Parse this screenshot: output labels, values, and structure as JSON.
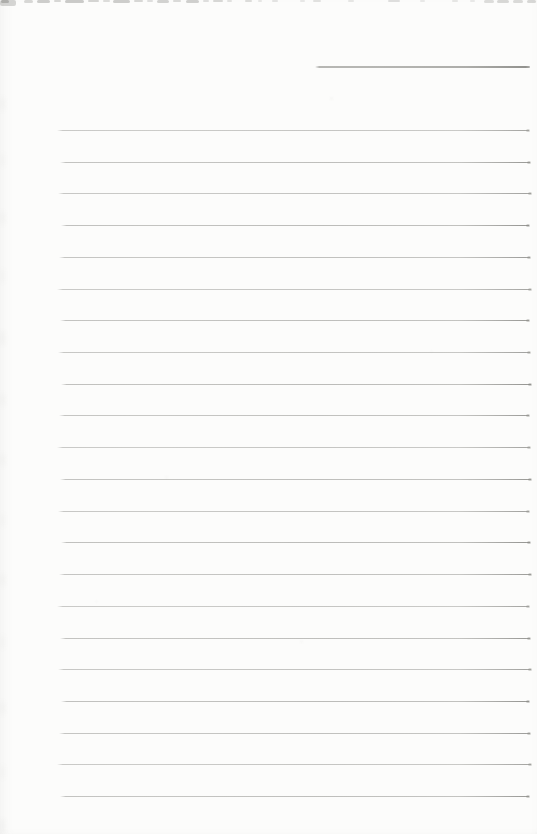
{
  "document": {
    "kind": "scanned blank ruled notebook page",
    "background_color": "#fcfcfb",
    "rule_color": "#a7a7a4",
    "header_line": {
      "x": 315,
      "y": 66,
      "width": 215
    },
    "ruled_lines": {
      "count": 22,
      "x": 59,
      "right_x": 530,
      "first_y": 130,
      "spacing": 31.72,
      "thickness": 1
    },
    "scan_artifacts": {
      "top_edge_dashes": [
        {
          "x": 0,
          "w": 16,
          "h": 6,
          "o": 0.3
        },
        {
          "x": 1,
          "w": 8,
          "h": 3,
          "o": 0.42
        },
        {
          "x": 24,
          "w": 9,
          "h": 3,
          "o": 0.28
        },
        {
          "x": 37,
          "w": 13,
          "h": 3,
          "o": 0.36
        },
        {
          "x": 54,
          "w": 7,
          "h": 2,
          "o": 0.28
        },
        {
          "x": 65,
          "w": 19,
          "h": 3,
          "o": 0.38
        },
        {
          "x": 88,
          "w": 11,
          "h": 2,
          "o": 0.3
        },
        {
          "x": 103,
          "w": 7,
          "h": 2,
          "o": 0.24
        },
        {
          "x": 113,
          "w": 17,
          "h": 3,
          "o": 0.36
        },
        {
          "x": 134,
          "w": 9,
          "h": 2,
          "o": 0.28
        },
        {
          "x": 147,
          "w": 6,
          "h": 2,
          "o": 0.22
        },
        {
          "x": 157,
          "w": 12,
          "h": 3,
          "o": 0.32
        },
        {
          "x": 173,
          "w": 8,
          "h": 2,
          "o": 0.26
        },
        {
          "x": 186,
          "w": 13,
          "h": 3,
          "o": 0.34
        },
        {
          "x": 203,
          "w": 6,
          "h": 2,
          "o": 0.22
        },
        {
          "x": 213,
          "w": 10,
          "h": 2,
          "o": 0.28
        },
        {
          "x": 227,
          "w": 5,
          "h": 2,
          "o": 0.2
        },
        {
          "x": 245,
          "w": 7,
          "h": 2,
          "o": 0.24
        },
        {
          "x": 258,
          "w": 4,
          "h": 2,
          "o": 0.16
        },
        {
          "x": 272,
          "w": 6,
          "h": 2,
          "o": 0.18
        },
        {
          "x": 300,
          "w": 5,
          "h": 2,
          "o": 0.15
        },
        {
          "x": 313,
          "w": 8,
          "h": 2,
          "o": 0.2
        },
        {
          "x": 348,
          "w": 6,
          "h": 2,
          "o": 0.16
        },
        {
          "x": 388,
          "w": 12,
          "h": 2,
          "o": 0.22
        },
        {
          "x": 420,
          "w": 5,
          "h": 2,
          "o": 0.14
        },
        {
          "x": 452,
          "w": 6,
          "h": 2,
          "o": 0.16
        },
        {
          "x": 470,
          "w": 5,
          "h": 2,
          "o": 0.14
        },
        {
          "x": 484,
          "w": 10,
          "h": 3,
          "o": 0.24
        },
        {
          "x": 497,
          "w": 12,
          "h": 3,
          "o": 0.28
        },
        {
          "x": 513,
          "w": 10,
          "h": 3,
          "o": 0.26
        },
        {
          "x": 527,
          "w": 9,
          "h": 3,
          "o": 0.28
        }
      ],
      "left_edge_smudges": [
        {
          "y": 96,
          "o": 0.05
        },
        {
          "y": 152,
          "o": 0.04
        },
        {
          "y": 210,
          "o": 0.05
        },
        {
          "y": 268,
          "o": 0.04
        },
        {
          "y": 330,
          "o": 0.06
        },
        {
          "y": 392,
          "o": 0.05
        },
        {
          "y": 452,
          "o": 0.05
        },
        {
          "y": 512,
          "o": 0.04
        },
        {
          "y": 572,
          "o": 0.05
        },
        {
          "y": 634,
          "o": 0.04
        },
        {
          "y": 700,
          "o": 0.05
        },
        {
          "y": 764,
          "o": 0.04
        },
        {
          "y": 818,
          "o": 0.06
        }
      ],
      "specks": [
        {
          "x": 330,
          "y": 97,
          "o": 0.07
        },
        {
          "x": 165,
          "y": 476,
          "o": 0.06
        },
        {
          "x": 300,
          "y": 640,
          "o": 0.05
        },
        {
          "x": 95,
          "y": 600,
          "o": 0.04
        },
        {
          "x": 430,
          "y": 350,
          "o": 0.04
        }
      ]
    }
  }
}
